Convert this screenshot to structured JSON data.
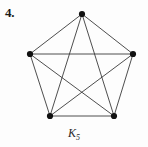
{
  "figure": {
    "item_number": "4.",
    "caption_base": "K",
    "caption_subscript": "5",
    "caption_full": "K5"
  },
  "chart_data": {
    "type": "diagram",
    "diagram_kind": "graph",
    "title": "K5",
    "vertex_count": 5,
    "edge_count": 10,
    "vertex_color": "#111111",
    "edge_color": "#3a3a3a",
    "background_color": "#fdfdfd",
    "vertex_radius": 3.1,
    "edge_width": 0.9,
    "vertices": [
      {
        "id": "v1",
        "label": "",
        "x": 82,
        "y": 14
      },
      {
        "id": "v2",
        "label": "",
        "x": 133,
        "y": 54
      },
      {
        "id": "v3",
        "label": "",
        "x": 114,
        "y": 116
      },
      {
        "id": "v4",
        "label": "",
        "x": 50,
        "y": 116
      },
      {
        "id": "v5",
        "label": "",
        "x": 30,
        "y": 54
      }
    ],
    "edges": [
      {
        "from": "v1",
        "to": "v2",
        "kind": "side"
      },
      {
        "from": "v2",
        "to": "v3",
        "kind": "side"
      },
      {
        "from": "v3",
        "to": "v4",
        "kind": "side"
      },
      {
        "from": "v4",
        "to": "v5",
        "kind": "side"
      },
      {
        "from": "v5",
        "to": "v1",
        "kind": "side"
      },
      {
        "from": "v1",
        "to": "v3",
        "kind": "diagonal"
      },
      {
        "from": "v1",
        "to": "v4",
        "kind": "diagonal"
      },
      {
        "from": "v2",
        "to": "v4",
        "kind": "diagonal"
      },
      {
        "from": "v2",
        "to": "v5",
        "kind": "diagonal"
      },
      {
        "from": "v3",
        "to": "v5",
        "kind": "diagonal"
      }
    ]
  }
}
